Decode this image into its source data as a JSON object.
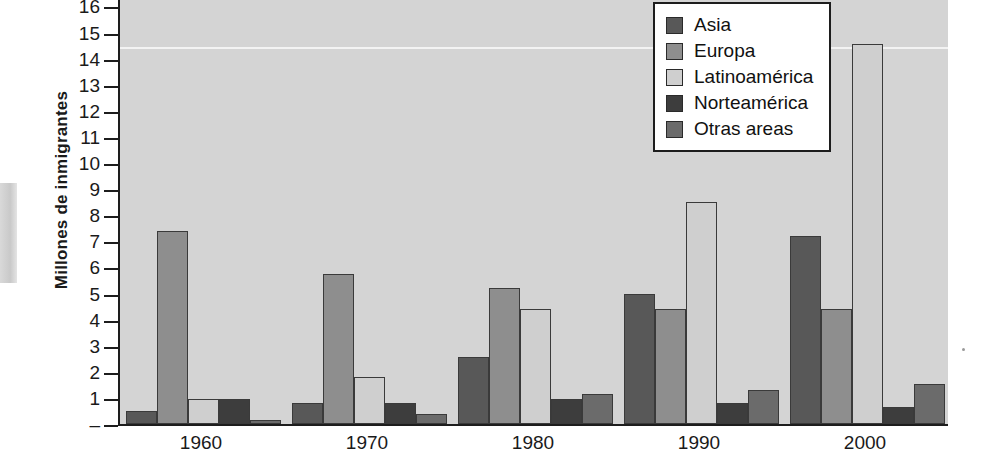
{
  "chart_data": {
    "type": "bar",
    "title": "",
    "xlabel": "",
    "ylabel": "Millones de inmigrantes",
    "categories": [
      "1960",
      "1970",
      "1980",
      "1990",
      "2000"
    ],
    "series": [
      {
        "name": "Asia",
        "color": "#585858",
        "values": [
          0.5,
          0.8,
          2.55,
          5.0,
          7.2
        ]
      },
      {
        "name": "Europa",
        "color": "#8e8e8e",
        "values": [
          7.4,
          5.75,
          5.2,
          4.4,
          4.4
        ]
      },
      {
        "name": "Latinoamérica",
        "color": "#cfcfcf",
        "values": [
          0.95,
          1.8,
          4.4,
          8.5,
          14.55
        ]
      },
      {
        "name": "Norteamérica",
        "color": "#3d3d3d",
        "values": [
          0.95,
          0.8,
          0.95,
          0.8,
          0.65
        ]
      },
      {
        "name": "Otras areas",
        "color": "#6b6b6b",
        "values": [
          0.15,
          0.4,
          1.15,
          1.3,
          1.55
        ]
      }
    ],
    "ylim": [
      0,
      16
    ],
    "yticks": [
      "16",
      "15",
      "14",
      "13",
      "12",
      "11",
      "10",
      "9",
      "8",
      "7",
      "6",
      "5",
      "4",
      "3",
      "2",
      "1",
      "–"
    ],
    "ytick_values": [
      16,
      15,
      14,
      13,
      12,
      11,
      10,
      9,
      8,
      7,
      6,
      5,
      4,
      3,
      2,
      1,
      0
    ],
    "grid": "single-white-line-at-14.5",
    "gridline_value": 14.5,
    "legend_position": "top-right",
    "plot_background": "#d7d7d7"
  },
  "legend": {
    "items": [
      {
        "label": "Asia",
        "swatch": "#585858"
      },
      {
        "label": "Europa",
        "swatch": "#8e8e8e"
      },
      {
        "label": "Latinoamérica",
        "swatch": "#cfcfcf"
      },
      {
        "label": "Norteamérica",
        "swatch": "#3d3d3d"
      },
      {
        "label": "Otras areas",
        "swatch": "#6b6b6b"
      }
    ]
  }
}
